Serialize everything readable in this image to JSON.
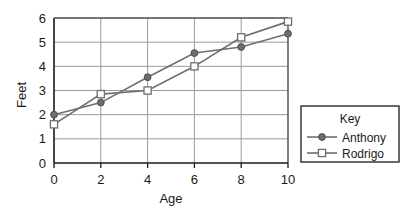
{
  "chart_data": {
    "type": "line",
    "title": "",
    "xlabel": "Age",
    "ylabel": "Feet",
    "xlim": [
      0,
      10
    ],
    "ylim": [
      0,
      6
    ],
    "xticks": [
      "0",
      "2",
      "4",
      "6",
      "8",
      "10"
    ],
    "yticks": [
      "0",
      "1",
      "2",
      "3",
      "4",
      "5",
      "6"
    ],
    "grid": "horizontal-and-vertical",
    "legend_position": "right-outside",
    "legend_title": "Key",
    "x": [
      0,
      2,
      4,
      6,
      8,
      10
    ],
    "series": [
      {
        "name": "Anthony",
        "marker": "filled-circle",
        "color": "#6e6e6e",
        "values": [
          2.0,
          2.5,
          3.55,
          4.55,
          4.8,
          5.35
        ]
      },
      {
        "name": "Rodrigo",
        "marker": "open-square",
        "color": "#6e6e6e",
        "values": [
          1.6,
          2.85,
          3.0,
          4.0,
          5.2,
          5.85
        ]
      }
    ]
  },
  "legend": {
    "title": "Key",
    "entries": [
      {
        "label": "Anthony",
        "marker": "filled-circle-marker"
      },
      {
        "label": "Rodrigo",
        "marker": "open-square-marker"
      }
    ]
  },
  "axes": {
    "x_title": "Age",
    "y_title": "Feet",
    "x_tick_labels": [
      "0",
      "2",
      "4",
      "6",
      "8",
      "10"
    ],
    "y_tick_labels": [
      "0",
      "1",
      "2",
      "3",
      "4",
      "5",
      "6"
    ]
  },
  "colors": {
    "line": "#6e6e6e",
    "axis": "#1a1a1a",
    "grid": "#9a9a9a",
    "text": "#1a1a1a",
    "background": "#ffffff"
  }
}
